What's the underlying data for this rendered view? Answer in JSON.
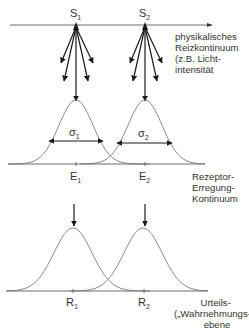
{
  "diagram": {
    "stimuli": [
      {
        "label": "S",
        "index": "1"
      },
      {
        "label": "S",
        "index": "2"
      }
    ],
    "stimulus_axis_label": [
      "physikalisches",
      "Reizkontinuum",
      "(z.B. Licht-",
      "intensität"
    ],
    "sigmas": [
      {
        "label": "σ",
        "index": "1"
      },
      {
        "label": "σ",
        "index": "2"
      }
    ],
    "excitations": [
      {
        "label": "E",
        "index": "1"
      },
      {
        "label": "E",
        "index": "2"
      }
    ],
    "excitation_axis_label": [
      "Rezeptor-",
      "Erregung-",
      "Kontinuum"
    ],
    "responses": [
      {
        "label": "R",
        "index": "1"
      },
      {
        "label": "R",
        "index": "2"
      }
    ],
    "response_axis_label": [
      "Urteils-",
      "(„Wahrnehmungs-“)",
      "ebene"
    ],
    "arrows_per_stimulus": 5
  }
}
